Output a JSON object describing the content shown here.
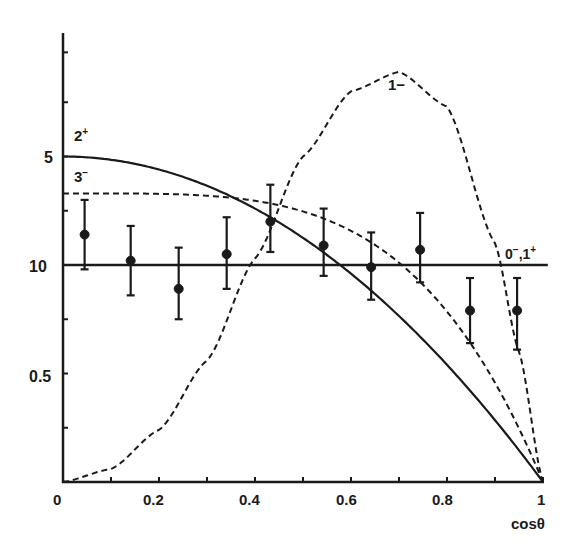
{
  "chart_data": {
    "type": "line",
    "title": "",
    "xlabel": "cosθ",
    "ylabel": "",
    "xlim": [
      0,
      1
    ],
    "ylim": [
      0,
      2.05
    ],
    "grid": false,
    "x_tick_labels": [
      "0",
      "0.2",
      "0.4",
      "0.6",
      "0.8",
      "1"
    ],
    "x_ticks": [
      0,
      0.1,
      0.2,
      0.3,
      0.4,
      0.5,
      0.6,
      0.7,
      0.8,
      0.9,
      1.0
    ],
    "y_tick_labels": [
      {
        "value": 1.5,
        "label": "5"
      },
      {
        "value": 1.0,
        "label": "10"
      },
      {
        "value": 0.5,
        "label": "0.5"
      }
    ],
    "y_ticks": [
      0.25,
      0.5,
      0.75,
      1.0,
      1.25,
      1.5,
      1.75,
      1.98
    ],
    "series": [
      {
        "name": "0⁻,1⁺",
        "style": "solid",
        "label": "0⁻,1⁺",
        "formula": "1",
        "x": [
          0,
          1
        ],
        "y": [
          1.0,
          1.0
        ]
      },
      {
        "name": "2⁺",
        "style": "solid",
        "label": "2⁺",
        "formula": "1.5*(1-x^2)",
        "x": [
          0,
          0.2,
          0.4,
          0.6,
          0.8,
          1.0
        ],
        "y": [
          1.5,
          1.44,
          1.26,
          0.96,
          0.54,
          0.0
        ]
      },
      {
        "name": "3⁻",
        "style": "dashed",
        "label": "3⁻",
        "formula": "1.33*(1-x^4)",
        "x": [
          0,
          0.2,
          0.4,
          0.6,
          0.8,
          1.0
        ],
        "y": [
          1.33,
          1.33,
          1.3,
          1.16,
          0.79,
          0.0
        ]
      },
      {
        "name": "1−",
        "style": "dashed",
        "label": "1−",
        "formula": "6*x^2*(1-x^2)^0.5 scaled",
        "x": [
          0,
          0.1,
          0.2,
          0.3,
          0.4,
          0.5,
          0.6,
          0.7,
          0.8,
          0.9,
          0.95,
          1.0
        ],
        "y": [
          0.0,
          0.06,
          0.24,
          0.56,
          1.03,
          1.5,
          1.8,
          1.89,
          1.73,
          1.1,
          0.6,
          0.0
        ]
      }
    ],
    "data_points": [
      {
        "x": 0.045,
        "y": 1.14,
        "err_low": 0.98,
        "err_high": 1.3
      },
      {
        "x": 0.141,
        "y": 1.02,
        "err_low": 0.86,
        "err_high": 1.18
      },
      {
        "x": 0.241,
        "y": 0.89,
        "err_low": 0.75,
        "err_high": 1.08
      },
      {
        "x": 0.341,
        "y": 1.05,
        "err_low": 0.89,
        "err_high": 1.22
      },
      {
        "x": 0.432,
        "y": 1.2,
        "err_low": 1.06,
        "err_high": 1.37
      },
      {
        "x": 0.543,
        "y": 1.09,
        "err_low": 0.95,
        "err_high": 1.26
      },
      {
        "x": 0.642,
        "y": 0.99,
        "err_low": 0.84,
        "err_high": 1.15
      },
      {
        "x": 0.744,
        "y": 1.07,
        "err_low": 0.92,
        "err_high": 1.24
      },
      {
        "x": 0.848,
        "y": 0.79,
        "err_low": 0.64,
        "err_high": 0.94
      },
      {
        "x": 0.946,
        "y": 0.79,
        "err_low": 0.61,
        "err_high": 0.94
      }
    ],
    "annotations": [
      {
        "text": "2⁺",
        "x": 0.02,
        "y": 1.57
      },
      {
        "text": "3⁻",
        "x": 0.02,
        "y": 1.38
      },
      {
        "text": "1−",
        "x": 0.72,
        "y": 1.83
      },
      {
        "text": "0⁻,1⁺",
        "x": 0.91,
        "y": 1.03
      }
    ]
  },
  "labels": {
    "xlabel": "cosθ",
    "x_ticks": [
      "0",
      "0.2",
      "0.4",
      "0.6",
      "0.8",
      "1"
    ],
    "y_ticks": [
      "5",
      "10",
      "0.5"
    ],
    "curve_2p": "2",
    "curve_2p_sup": "+",
    "curve_3m": "3",
    "curve_3m_sup": "−",
    "curve_1m": "1−",
    "curve_01_a": "0",
    "curve_01_a_sup": "−",
    "curve_01_b": ",1",
    "curve_01_b_sup": "+"
  }
}
